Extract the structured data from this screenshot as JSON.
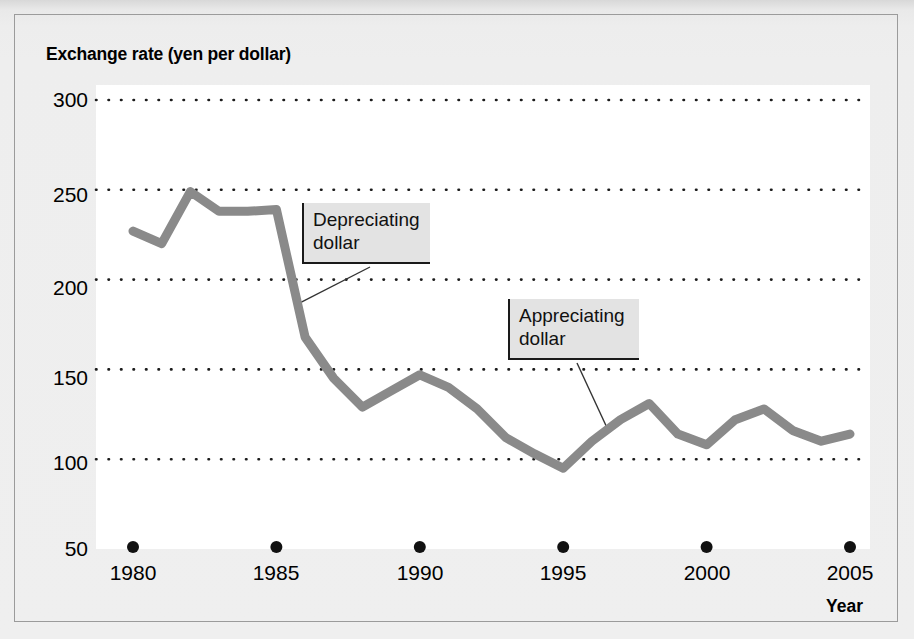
{
  "chart_data": {
    "type": "line",
    "title": "",
    "ylabel": "Exchange rate (yen per dollar)",
    "xlabel": "Year",
    "ylim": [
      50,
      300
    ],
    "xlim": [
      1980,
      2005
    ],
    "yticks": [
      300,
      250,
      200,
      150,
      100,
      50
    ],
    "xticks": [
      1980,
      1985,
      1990,
      1995,
      2000,
      2005
    ],
    "grid": "horizontal-dotted",
    "legend": "none",
    "line_color": "#8a8a8a",
    "x": [
      1980,
      1981,
      1982,
      1983,
      1984,
      1985,
      1986,
      1987,
      1988,
      1989,
      1990,
      1991,
      1992,
      1993,
      1994,
      1995,
      1996,
      1997,
      1998,
      1999,
      2000,
      2001,
      2002,
      2003,
      2004,
      2005
    ],
    "values": [
      227,
      220,
      249,
      238,
      238,
      239,
      168,
      145,
      129,
      138,
      147,
      140,
      128,
      112,
      103,
      95,
      110,
      122,
      131,
      114,
      108,
      122,
      128,
      116,
      110,
      114
    ],
    "series": [
      {
        "name": "Exchange rate (yen per dollar)",
        "values": [
          227,
          220,
          249,
          238,
          238,
          239,
          168,
          145,
          129,
          138,
          147,
          140,
          128,
          112,
          103,
          95,
          110,
          122,
          131,
          114,
          108,
          122,
          128,
          116,
          110,
          114
        ]
      }
    ],
    "annotations": [
      {
        "id": "depreciating-dollar",
        "text": "Depreciating\ndollar",
        "points_to_x": 1985.7,
        "points_to_y": 186
      },
      {
        "id": "appreciating-dollar",
        "text": "Appreciating\ndollar",
        "points_to_x": 1996.6,
        "points_to_y": 115
      }
    ]
  },
  "yticks": {
    "t0": "300",
    "t1": "250",
    "t2": "200",
    "t3": "150",
    "t4": "100",
    "t5": "50"
  },
  "xticks": {
    "t0": "1980",
    "t1": "1985",
    "t2": "1990",
    "t3": "1995",
    "t4": "2000",
    "t5": "2005"
  },
  "labels": {
    "y_axis_title": "Exchange rate (yen per dollar)",
    "x_axis_title": "Year"
  },
  "callouts": {
    "depreciating": "Depreciating\ndollar",
    "appreciating": "Appreciating\ndollar"
  },
  "colors": {
    "line": "#8a8a8a",
    "grid": "#1c1c1c",
    "plot_background": "#ffffff",
    "page_background": "#eeeeee",
    "callout_background": "#e3e3e3"
  }
}
